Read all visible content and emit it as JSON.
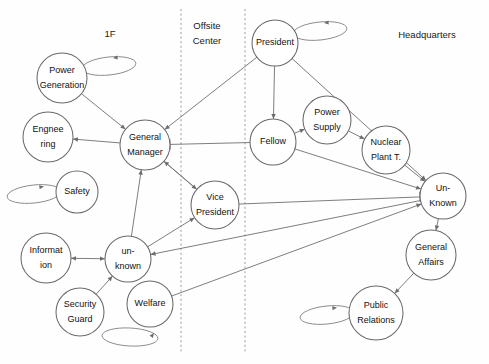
{
  "diagram": {
    "type": "node-link-graph",
    "width": 489,
    "height": 364,
    "background_color": "#fefefe",
    "node_stroke_color": "#6b6b6b",
    "edge_color": "#777777",
    "divider_color": "#9a9a9a",
    "text_color": "#111111"
  },
  "zones": [
    {
      "id": "zone-1f",
      "label": "1F",
      "x": 110,
      "y": 34
    },
    {
      "id": "zone-offsite-center",
      "label_line1": "Offsite",
      "label_line2": "Center",
      "x": 207,
      "y": 26
    },
    {
      "id": "zone-headquarters",
      "label": "Headquarters",
      "x": 427,
      "y": 35
    }
  ],
  "dividers": [
    {
      "id": "divider-left",
      "x": 181,
      "y1": 9,
      "y2": 353
    },
    {
      "id": "divider-right",
      "x": 245,
      "y1": 9,
      "y2": 353
    }
  ],
  "nodes": [
    {
      "id": "power-generation",
      "label_line1": "Power",
      "label_line2": "Generation",
      "cx": 62,
      "cy": 78,
      "r": 25,
      "self_loop": true,
      "loop_side": "right"
    },
    {
      "id": "engineering",
      "label_line1": "Engnee",
      "label_line2": "ring",
      "cx": 48,
      "cy": 137,
      "r": 25,
      "self_loop": false
    },
    {
      "id": "general-manager",
      "label_line1": "General",
      "label_line2": "Manager",
      "cx": 145,
      "cy": 145,
      "r": 25,
      "self_loop": false
    },
    {
      "id": "safety",
      "label_line1": "Safety",
      "label_line2": "",
      "cx": 77,
      "cy": 192,
      "r": 21,
      "self_loop": true,
      "loop_side": "left"
    },
    {
      "id": "information",
      "label_line1": "Informat",
      "label_line2": "ion",
      "cx": 46,
      "cy": 258,
      "r": 25,
      "self_loop": false
    },
    {
      "id": "unknown-lower",
      "label_line1": "un-",
      "label_line2": "known",
      "cx": 128,
      "cy": 259,
      "r": 23,
      "self_loop": false
    },
    {
      "id": "security-guard",
      "label_line1": "Security",
      "label_line2": "Guard",
      "cx": 80,
      "cy": 312,
      "r": 24,
      "self_loop": false
    },
    {
      "id": "welfare",
      "label_line1": "Welfare",
      "label_line2": "",
      "cx": 150,
      "cy": 304,
      "r": 23,
      "self_loop": true,
      "loop_side": "bottom-left"
    },
    {
      "id": "vice-president",
      "label_line1": "Vice",
      "label_line2": "President",
      "cx": 215,
      "cy": 205,
      "r": 24,
      "self_loop": false
    },
    {
      "id": "president",
      "label_line1": "President",
      "label_line2": "",
      "cx": 275,
      "cy": 43,
      "r": 23,
      "self_loop": true,
      "loop_side": "right"
    },
    {
      "id": "fellow",
      "label_line1": "Fellow",
      "label_line2": "",
      "cx": 273,
      "cy": 142,
      "r": 23,
      "self_loop": false
    },
    {
      "id": "power-supply",
      "label_line1": "Power",
      "label_line2": "Supply",
      "cx": 327,
      "cy": 120,
      "r": 24,
      "self_loop": false
    },
    {
      "id": "nuclear-plant-t",
      "label_line1": "Nuclear",
      "label_line2": "Plant T.",
      "cx": 386,
      "cy": 150,
      "r": 24,
      "self_loop": false
    },
    {
      "id": "unknown-right",
      "label_line1": "Un-",
      "label_line2": "Known",
      "cx": 443,
      "cy": 196,
      "r": 23,
      "self_loop": false
    },
    {
      "id": "general-affairs",
      "label_line1": "General",
      "label_line2": "Affairs",
      "cx": 431,
      "cy": 255,
      "r": 25,
      "self_loop": false
    },
    {
      "id": "public-relations",
      "label_line1": "Public",
      "label_line2": "Relations",
      "cx": 376,
      "cy": 313,
      "r": 27,
      "self_loop": true,
      "loop_side": "left"
    }
  ],
  "edges": [
    {
      "id": "edge-power-generation-general-manager",
      "from": "power-generation",
      "to": "general-manager",
      "head": "arrow"
    },
    {
      "id": "edge-general-manager-engineering",
      "from": "general-manager",
      "to": "engineering",
      "head": "arrow"
    },
    {
      "id": "edge-president-general-manager",
      "from": "president",
      "to": "general-manager",
      "head": "arrow"
    },
    {
      "id": "edge-fellow-general-manager",
      "from": "fellow",
      "to": "general-manager",
      "head": "tbar"
    },
    {
      "id": "edge-unknown-lower-general-manager",
      "from": "unknown-lower",
      "to": "general-manager",
      "head": "arrow"
    },
    {
      "id": "edge-vice-president-general-manager",
      "from": "vice-president",
      "to": "general-manager",
      "head": "arrow"
    },
    {
      "id": "edge-general-manager-vice-president",
      "from": "general-manager",
      "to": "vice-president",
      "head": "arrow"
    },
    {
      "id": "edge-unknown-lower-vice-president",
      "from": "unknown-lower",
      "to": "vice-president",
      "head": "arrow"
    },
    {
      "id": "edge-information-unknown-lower",
      "from": "information",
      "to": "unknown-lower",
      "head": "arrow-both"
    },
    {
      "id": "edge-security-guard-unknown-lower",
      "from": "security-guard",
      "to": "unknown-lower",
      "head": "arrow"
    },
    {
      "id": "edge-unknown-right-unknown-lower",
      "from": "unknown-right",
      "to": "unknown-lower",
      "head": "arrow"
    },
    {
      "id": "edge-president-fellow",
      "from": "president",
      "to": "fellow",
      "head": "arrow"
    },
    {
      "id": "edge-fellow-power-supply",
      "from": "fellow",
      "to": "power-supply",
      "head": "arrow"
    },
    {
      "id": "edge-power-supply-nuclear-plant-t",
      "from": "power-supply",
      "to": "nuclear-plant-t",
      "head": "arrow"
    },
    {
      "id": "edge-president-unknown-right",
      "from": "president",
      "to": "unknown-right",
      "head": "arrow"
    },
    {
      "id": "edge-fellow-unknown-right",
      "from": "fellow",
      "to": "unknown-right",
      "head": "arrow"
    },
    {
      "id": "edge-nuclear-plant-t-unknown-right",
      "from": "nuclear-plant-t",
      "to": "unknown-right",
      "head": "arrow"
    },
    {
      "id": "edge-vice-president-unknown-right",
      "from": "vice-president",
      "to": "unknown-right",
      "head": "tbar"
    },
    {
      "id": "edge-welfare-unknown-right",
      "from": "welfare",
      "to": "unknown-right",
      "head": "arrow"
    },
    {
      "id": "edge-unknown-right-general-affairs",
      "from": "unknown-right",
      "to": "general-affairs",
      "head": "arrow"
    },
    {
      "id": "edge-general-affairs-public-relations",
      "from": "general-affairs",
      "to": "public-relations",
      "head": "arrow"
    }
  ]
}
